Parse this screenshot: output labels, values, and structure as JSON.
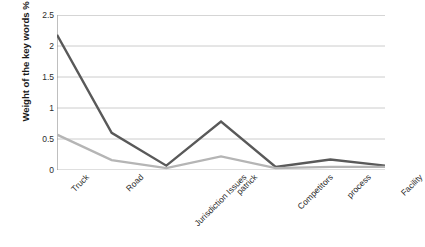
{
  "chart_data": {
    "type": "line",
    "title": "",
    "subtitle": "",
    "xlabel": "",
    "ylabel": "Weight of the key words %",
    "categories": [
      "Truck",
      "Road",
      "Jurisdiction Issues",
      "patrick",
      "Competitors",
      "process",
      "Facility"
    ],
    "series": [
      {
        "name": "series-dark",
        "color": "#595959",
        "values": [
          2.18,
          0.6,
          0.07,
          0.78,
          0.05,
          0.17,
          0.07
        ]
      },
      {
        "name": "series-light",
        "color": "#b5b5b5",
        "values": [
          0.57,
          0.16,
          0.03,
          0.22,
          0.03,
          0.05,
          0.05
        ]
      }
    ],
    "ylim": [
      0,
      2.5
    ],
    "yticks": [
      0,
      0.5,
      1,
      1.5,
      2,
      2.5
    ],
    "ytick_labels": [
      "0",
      "0.5",
      "1",
      "1.5",
      "2",
      "2.5"
    ],
    "grid": true,
    "grid_axis": "y",
    "grid_color": "#bfbfbf",
    "legend": false,
    "legend_position": "none",
    "markers": false,
    "background": "#ffffff",
    "axis_color": "#808080"
  },
  "axis": {
    "y_title": "Weight of the key words %"
  }
}
